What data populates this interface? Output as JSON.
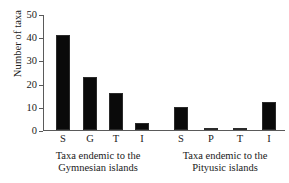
{
  "chart_data": {
    "type": "bar",
    "title": "",
    "xlabel": "",
    "ylabel": "Number of taxa",
    "ylim": [
      0,
      50
    ],
    "yticks": [
      0,
      10,
      20,
      30,
      40,
      50
    ],
    "grid": false,
    "legend": null,
    "categories": [
      "S",
      "G",
      "T",
      "I",
      "S",
      "P",
      "T",
      "I"
    ],
    "values": [
      41,
      23,
      16,
      3,
      10,
      1,
      1,
      12
    ],
    "groups": [
      {
        "caption_line1": "Taxa endemic to the",
        "caption_line2": "Gymnesian islands",
        "categories": [
          "S",
          "G",
          "T",
          "I"
        ],
        "values": [
          41,
          23,
          16,
          3
        ]
      },
      {
        "caption_line1": "Taxa endemic to the",
        "caption_line2": "Pityusic islands",
        "categories": [
          "S",
          "P",
          "T",
          "I"
        ],
        "values": [
          10,
          1,
          1,
          12
        ]
      }
    ],
    "bar_color": "#0a0a0a",
    "axis_color": "#5a5a5a"
  }
}
